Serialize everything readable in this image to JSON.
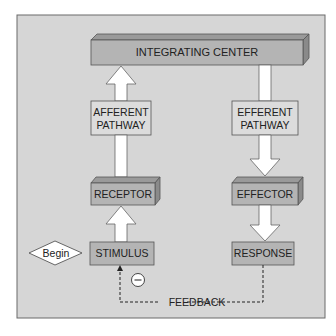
{
  "diagram": {
    "nodes": {
      "integrating_center": "INTEGRATING CENTER",
      "afferent_pathway": [
        "AFFERENT",
        "PATHWAY"
      ],
      "efferent_pathway": [
        "EFFERENT",
        "PATHWAY"
      ],
      "receptor": "RECEPTOR",
      "effector": "EFFECTOR",
      "stimulus": "STIMULUS",
      "response": "RESPONSE",
      "begin": "Begin"
    },
    "feedback": {
      "label": "FEEDBACK",
      "sign": "−",
      "type": "negative"
    },
    "edges": [
      {
        "from": "Begin",
        "to": "STIMULUS"
      },
      {
        "from": "STIMULUS",
        "to": "RECEPTOR"
      },
      {
        "from": "RECEPTOR",
        "to": "AFFERENT PATHWAY"
      },
      {
        "from": "AFFERENT PATHWAY",
        "to": "INTEGRATING CENTER"
      },
      {
        "from": "INTEGRATING CENTER",
        "to": "EFFERENT PATHWAY"
      },
      {
        "from": "EFFERENT PATHWAY",
        "to": "EFFECTOR"
      },
      {
        "from": "EFFECTOR",
        "to": "RESPONSE"
      },
      {
        "from": "RESPONSE",
        "to": "STIMULUS",
        "style": "dashed",
        "label": "FEEDBACK"
      }
    ],
    "colors": {
      "panel": "#d6d6d6",
      "box_front": "#b4b4b4",
      "box_top": "#9a9a9a",
      "box_side": "#8a8a8a",
      "plain_box": "#dcdcdc",
      "arrow": "#ffffff",
      "border": "#555555"
    }
  }
}
